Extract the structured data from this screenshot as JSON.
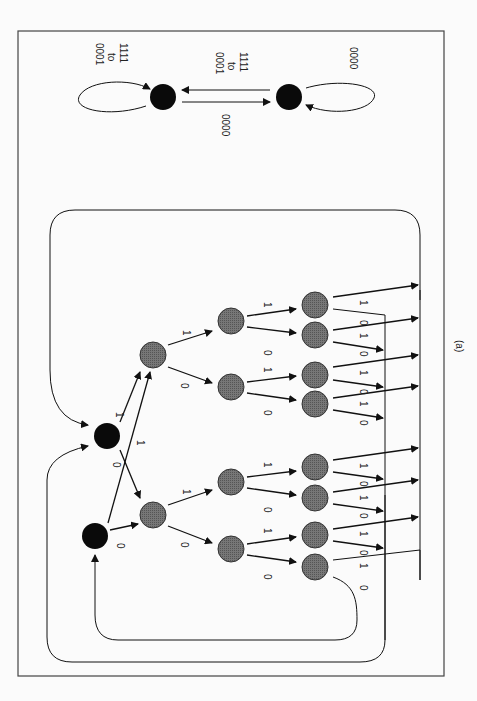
{
  "figure": {
    "caption": "(a)",
    "orientation": "rotated 90 degrees clockwise"
  },
  "state_machine": {
    "self_loop_left_label": [
      "0001",
      "to",
      "1111"
    ],
    "transition_top_label": [
      "0001",
      "to",
      "1111"
    ],
    "transition_bottom_label": "0000",
    "self_loop_right_label": "0000"
  },
  "tree": {
    "root_edge_labels": {
      "a_one": "1",
      "a_zero": "0",
      "b_one": "1",
      "b_zero": "0"
    },
    "level1_labels": {
      "upper_one": "1",
      "upper_zero": "0",
      "lower_one": "1",
      "lower_zero": "0"
    },
    "level2_labels": [
      "1",
      "0",
      "1",
      "0",
      "1",
      "0",
      "1",
      "0"
    ],
    "level3_labels": [
      "1",
      "0",
      "1",
      "0",
      "1",
      "0",
      "1",
      "0",
      "1",
      "0",
      "1",
      "0",
      "1",
      "0",
      "1",
      "0"
    ]
  },
  "colors": {
    "black_node": "#0a0a0a",
    "grey_node": "#6a6a6a",
    "line": "#1a1a1a",
    "frame": "#444444"
  }
}
